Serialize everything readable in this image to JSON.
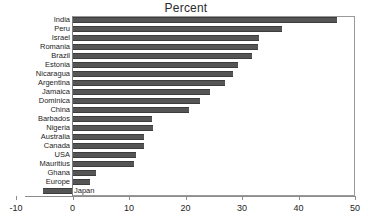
{
  "chart_data": {
    "type": "bar",
    "orientation": "horizontal",
    "title": "Percent",
    "xlabel": "",
    "ylabel": "",
    "xlim": [
      -10,
      50
    ],
    "xticks": [
      "-10",
      "0",
      "10",
      "20",
      "30",
      "40",
      "50"
    ],
    "xtick_values": [
      -10,
      0,
      10,
      20,
      30,
      40,
      50
    ],
    "grid": false,
    "legend": false,
    "bar_color": "#555555",
    "frame_color": "#9a9a9a",
    "categories": [
      "India",
      "Peru",
      "Israel",
      "Romania",
      "Brazil",
      "Estonia",
      "Nicaragua",
      "Argentina",
      "Jamaica",
      "Dominica",
      "China",
      "Barbados",
      "Nigeria",
      "Australia",
      "Canada",
      "USA",
      "Mauritius",
      "Ghana",
      "Europe",
      "Japan"
    ],
    "values": [
      46.8,
      37.1,
      33.0,
      32.8,
      31.8,
      29.3,
      28.4,
      27.0,
      24.3,
      22.5,
      20.6,
      14.1,
      14.3,
      12.7,
      12.7,
      11.3,
      10.9,
      4.2,
      3.1,
      -5.3
    ],
    "label_placement": [
      "outside-left",
      "outside-left",
      "outside-left",
      "outside-left",
      "outside-left",
      "outside-left",
      "outside-left",
      "outside-left",
      "outside-left",
      "outside-left",
      "outside-left",
      "outside-left",
      "outside-left",
      "outside-left",
      "outside-left",
      "outside-left",
      "outside-left",
      "outside-left",
      "outside-left",
      "inside-right"
    ]
  }
}
